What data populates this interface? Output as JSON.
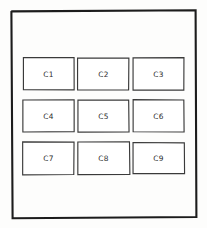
{
  "canvas": {
    "width": 207,
    "height": 228,
    "background_color": "#fdfdfc",
    "style": "hand-drawn-wireframe-sketch"
  },
  "frame": {
    "name": "outer-frame",
    "stroke_color": "#1c1c1c",
    "x": 11,
    "y": 10,
    "width": 185,
    "height": 208
  },
  "grid": {
    "rows": 3,
    "columns": 3,
    "cell_width": 51,
    "cell_height": 32,
    "column_x": [
      23,
      78,
      133
    ],
    "row_y": [
      58,
      100,
      142
    ],
    "cell_stroke_color": "#3a3a3a",
    "cell_fill_color": "#ffffff",
    "label_color": "#2b2b2b",
    "cells": [
      {
        "label": "C1",
        "row": 0,
        "col": 0
      },
      {
        "label": "C2",
        "row": 0,
        "col": 1
      },
      {
        "label": "C3",
        "row": 0,
        "col": 2
      },
      {
        "label": "C4",
        "row": 1,
        "col": 0
      },
      {
        "label": "C5",
        "row": 1,
        "col": 1
      },
      {
        "label": "C6",
        "row": 1,
        "col": 2
      },
      {
        "label": "C7",
        "row": 2,
        "col": 0
      },
      {
        "label": "C8",
        "row": 2,
        "col": 1
      },
      {
        "label": "C9",
        "row": 2,
        "col": 2
      }
    ]
  }
}
